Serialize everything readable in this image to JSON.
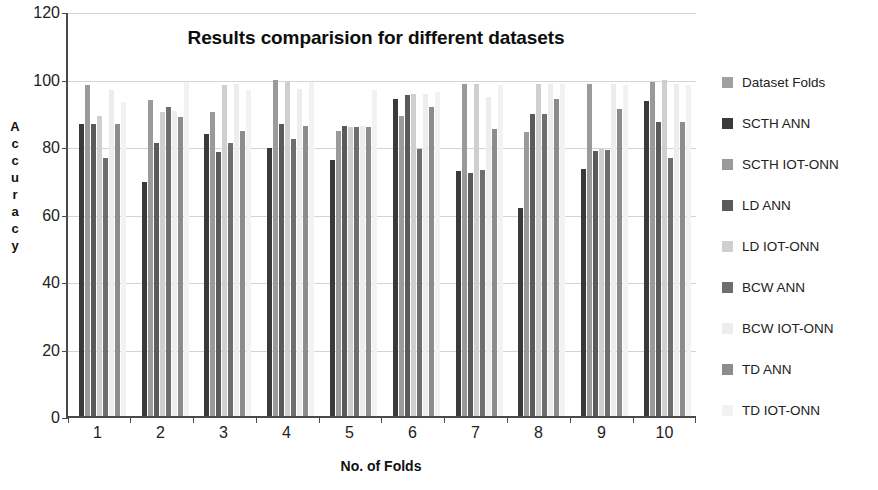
{
  "chart_data": {
    "type": "bar",
    "title": "Results comparision for different datasets",
    "xlabel": "No. of Folds",
    "ylabel": "Accuracy",
    "ylabel_letters": [
      "A",
      "c",
      "c",
      "u",
      "r",
      "a",
      "c",
      "y"
    ],
    "categories": [
      "1",
      "2",
      "3",
      "4",
      "5",
      "6",
      "7",
      "8",
      "9",
      "10"
    ],
    "ylim": [
      0,
      120
    ],
    "yticks": [
      0,
      20,
      40,
      60,
      80,
      100,
      120
    ],
    "grid": true,
    "legend_position": "right",
    "series": [
      {
        "name": "Dataset Folds",
        "color": "#a0a0a0",
        "values": [
          0,
          0,
          0,
          0,
          0,
          0,
          0,
          0,
          0,
          0
        ]
      },
      {
        "name": "SCTH ANN",
        "color": "#3a3a3a",
        "values": [
          86.5,
          69.2,
          83.5,
          79.5,
          75.8,
          94.0,
          72.5,
          61.5,
          73.2,
          93.2
        ]
      },
      {
        "name": "SCTH IOT-ONN",
        "color": "#9a9a9a",
        "values": [
          98.0,
          93.5,
          90.0,
          99.5,
          84.5,
          89.0,
          98.5,
          84.2,
          98.5,
          99.0
        ]
      },
      {
        "name": "LD ANN",
        "color": "#5a5a5a",
        "values": [
          86.5,
          81.0,
          78.3,
          86.5,
          86.0,
          95.0,
          72.0,
          89.5,
          78.5,
          87.0
        ]
      },
      {
        "name": "LD IOT-ONN",
        "color": "#cfcfcf",
        "values": [
          88.8,
          90.0,
          98.0,
          99.0,
          85.5,
          95.5,
          98.5,
          98.5,
          79.0,
          99.5
        ]
      },
      {
        "name": "BCW ANN",
        "color": "#6e6e6e",
        "values": [
          76.5,
          91.5,
          81.0,
          82.0,
          85.5,
          79.0,
          73.0,
          89.5,
          78.8,
          76.5
        ]
      },
      {
        "name": "BCW IOT-ONN",
        "color": "#ededed",
        "values": [
          96.5,
          90.5,
          98.5,
          97.0,
          86.0,
          95.5,
          94.5,
          98.5,
          98.5,
          98.5
        ]
      },
      {
        "name": "TD ANN",
        "color": "#8c8c8c",
        "values": [
          86.5,
          88.5,
          84.5,
          86.0,
          85.5,
          91.5,
          85.0,
          94.0,
          91.0,
          87.0
        ]
      },
      {
        "name": "TD IOT-ONN",
        "color": "#f2f2f2",
        "values": [
          93.0,
          99.0,
          96.5,
          99.0,
          96.5,
          96.0,
          98.0,
          98.5,
          98.0,
          98.0
        ]
      }
    ]
  },
  "axis": {
    "y_title": "Accuracy",
    "x_title": "No. of Folds",
    "y_tick_labels": [
      "120",
      "100",
      "80",
      "60",
      "40",
      "20",
      "0"
    ],
    "x_tick_labels": [
      "1",
      "2",
      "3",
      "4",
      "5",
      "6",
      "7",
      "8",
      "9",
      "10"
    ]
  },
  "legend": {
    "items": [
      {
        "label": "Dataset Folds",
        "color": "#a0a0a0"
      },
      {
        "label": "SCTH ANN",
        "color": "#3a3a3a"
      },
      {
        "label": "SCTH IOT-ONN",
        "color": "#9a9a9a"
      },
      {
        "label": "LD ANN",
        "color": "#5a5a5a"
      },
      {
        "label": "LD IOT-ONN",
        "color": "#cfcfcf"
      },
      {
        "label": "BCW ANN",
        "color": "#6e6e6e"
      },
      {
        "label": "BCW IOT-ONN",
        "color": "#ededed"
      },
      {
        "label": "TD ANN",
        "color": "#8c8c8c"
      },
      {
        "label": "TD IOT-ONN",
        "color": "#f2f2f2"
      }
    ]
  },
  "style": {
    "axis_color": "#4a4a4a",
    "grid_color": "#d4d4d4",
    "text_color": "#222222",
    "background": "#ffffff"
  }
}
